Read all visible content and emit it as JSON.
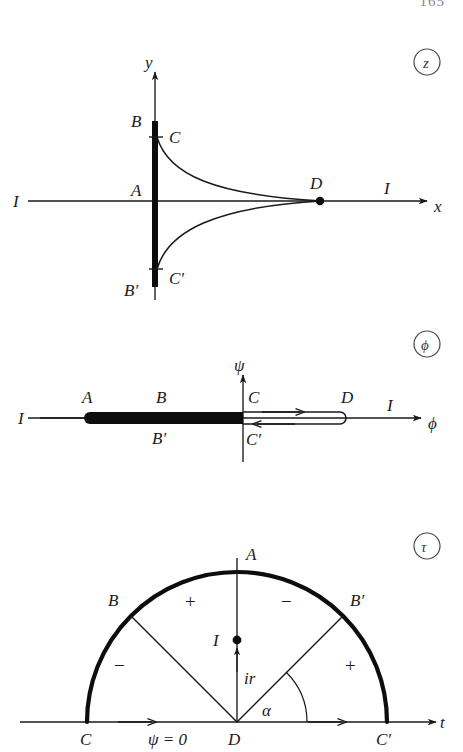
{
  "page": {
    "number": "165",
    "width": 463,
    "height": 752,
    "background": "#ffffff",
    "ink": "#1a1a1a"
  },
  "figure": {
    "caption_labels": [
      {
        "id": "plane-z",
        "symbol": "z"
      },
      {
        "id": "plane-phi",
        "symbol": "ϕ"
      },
      {
        "id": "plane-tau",
        "symbol": "τ"
      }
    ]
  },
  "panel_z": {
    "plane_symbol": "z",
    "axis_x_label": "x",
    "axis_y_label": "y",
    "labels": {
      "A": "A",
      "B": "B",
      "Bp": "B′",
      "C": "C",
      "Cp": "C′",
      "D": "D",
      "I_left": "I",
      "I_right": "I"
    },
    "geometry": {
      "origin_x": 155,
      "axis_y": 201,
      "bar_top_y": 121,
      "bar_bottom_y": 287,
      "c_y": 137,
      "cp_y": 269,
      "stagnation_x": 320,
      "x_axis_start": 28,
      "x_axis_arrow_x": 427,
      "y_axis_arrow_y": 72
    }
  },
  "panel_phi": {
    "plane_symbol": "ϕ",
    "axis_x_label": "ϕ",
    "axis_y_label": "ψ",
    "labels": {
      "A": "A",
      "B": "B",
      "Bp": "B′",
      "C": "C",
      "Cp": "C′",
      "D": "D",
      "I_left": "I",
      "I_right": "I"
    },
    "geometry": {
      "axis_y": 418,
      "psi_axis_x": 243,
      "slit_left_x": 82,
      "slit_right_x": 243,
      "loop_right_x": 346,
      "x_axis_start": 28,
      "x_axis_arrow_x": 421,
      "psi_arrow_top_y": 375,
      "psi_bottom_y": 462
    },
    "flow_arrows": [
      {
        "id": "upper-arrow-right",
        "direction": "right"
      },
      {
        "id": "lower-arrow-left",
        "direction": "left"
      }
    ]
  },
  "panel_tau": {
    "plane_symbol": "τ",
    "axis_x_label": "t",
    "labels": {
      "A": "A",
      "B": "B",
      "Bp": "B′",
      "C": "C",
      "Cp": "C′",
      "D": "D",
      "I": "I",
      "ir": "ir",
      "alpha": "α",
      "psi_zero": "ψ = 0"
    },
    "region_signs": {
      "upper_left": "+",
      "upper_right": "−",
      "far_left": "−",
      "far_right": "+"
    },
    "geometry": {
      "center_x": 237,
      "axis_y": 722,
      "radius": 150,
      "B_angle_deg": 135,
      "Bp_angle_deg": 45,
      "A_top_y": 572,
      "source_dot_y": 640,
      "axis_start_x": 20,
      "axis_arrow_x": 436
    },
    "flow_arrows": [
      {
        "id": "left-axis-arrow",
        "direction": "right"
      },
      {
        "id": "right-axis-arrow",
        "direction": "right"
      }
    ]
  }
}
